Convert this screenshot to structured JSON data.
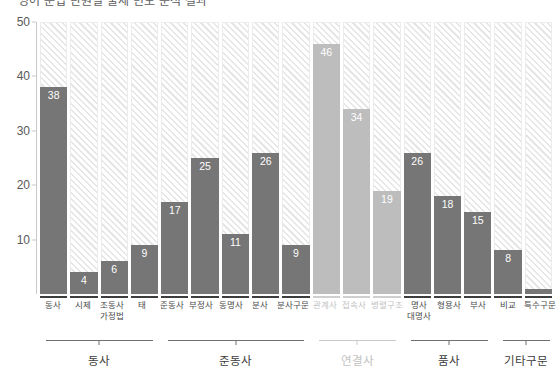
{
  "title": "영어 문법 단원별 출제 빈도 분석 결과",
  "chart_data": {
    "type": "bar",
    "title": "영어 문법 단원별 출제 빈도 분석 결과",
    "xlabel": "",
    "ylabel": "",
    "ylim": [
      0,
      50
    ],
    "yticks": [
      10,
      20,
      30,
      40,
      50
    ],
    "grid": false,
    "legend": "none",
    "categories": [
      "동사",
      "시제",
      "조동사\n가정법",
      "태",
      "준동사",
      "부정사",
      "동명사",
      "분사",
      "분사구문",
      "관계사",
      "접속사",
      "병렬구조",
      "명사\n대명사",
      "형용사",
      "부사",
      "비교",
      "특수구문"
    ],
    "values": [
      38,
      4,
      6,
      9,
      17,
      25,
      11,
      26,
      9,
      46,
      34,
      19,
      26,
      18,
      15,
      8,
      1
    ],
    "highlight_group": "연결사",
    "colors": {
      "bar": "#767676",
      "bar_highlight": "#bdbdbd",
      "track": "#e6e6e6",
      "axis": "#c9c9c9"
    }
  },
  "axis": {
    "yticks": [
      "50",
      "40",
      "30",
      "20",
      "10"
    ]
  },
  "bars": [
    {
      "label": "동사",
      "label2": "",
      "value": 38,
      "display": "38",
      "light": false
    },
    {
      "label": "시제",
      "label2": "",
      "value": 4,
      "display": "4",
      "light": false
    },
    {
      "label": "조동사",
      "label2": "가정법",
      "value": 6,
      "display": "6",
      "light": false
    },
    {
      "label": "태",
      "label2": "",
      "value": 9,
      "display": "9",
      "light": false
    },
    {
      "label": "준동사",
      "label2": "",
      "value": 17,
      "display": "17",
      "light": false
    },
    {
      "label": "부정사",
      "label2": "",
      "value": 25,
      "display": "25",
      "light": false
    },
    {
      "label": "동명사",
      "label2": "",
      "value": 11,
      "display": "11",
      "light": false
    },
    {
      "label": "분사",
      "label2": "",
      "value": 26,
      "display": "26",
      "light": false
    },
    {
      "label": "분사구문",
      "label2": "",
      "value": 9,
      "display": "9",
      "light": false
    },
    {
      "label": "관계사",
      "label2": "",
      "value": 46,
      "display": "46",
      "light": true
    },
    {
      "label": "접속사",
      "label2": "",
      "value": 34,
      "display": "34",
      "light": true
    },
    {
      "label": "병렬구조",
      "label2": "",
      "value": 19,
      "display": "19",
      "light": true
    },
    {
      "label": "명사",
      "label2": "대명사",
      "value": 26,
      "display": "26",
      "light": false
    },
    {
      "label": "형용사",
      "label2": "",
      "value": 18,
      "display": "18",
      "light": false
    },
    {
      "label": "부사",
      "label2": "",
      "value": 15,
      "display": "15",
      "light": false
    },
    {
      "label": "비교",
      "label2": "",
      "value": 8,
      "display": "8",
      "light": false
    },
    {
      "label": "특수구문",
      "label2": "",
      "value": 1,
      "display": "1",
      "light": false
    }
  ],
  "groups": [
    {
      "label": "동사",
      "span": 4,
      "dim": false
    },
    {
      "label": "준동사",
      "span": 5,
      "dim": false
    },
    {
      "label": "연결사",
      "span": 3,
      "dim": true
    },
    {
      "label": "품사",
      "span": 3,
      "dim": false
    },
    {
      "label": "기타구문",
      "span": 2,
      "dim": false
    }
  ]
}
